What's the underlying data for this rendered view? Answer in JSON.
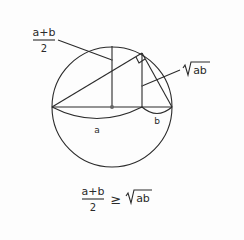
{
  "diagram": {
    "labels": {
      "mean_numerator": "a+b",
      "mean_denominator": "2",
      "geo_mean_radicand": "ab",
      "segment_a": "a",
      "segment_b": "b"
    },
    "formula": {
      "numerator": "a+b",
      "denominator": "2",
      "relation": "≥",
      "radicand": "ab"
    },
    "colors": {
      "stroke": "#2a2a2a",
      "background": "#fdfdfd"
    }
  }
}
